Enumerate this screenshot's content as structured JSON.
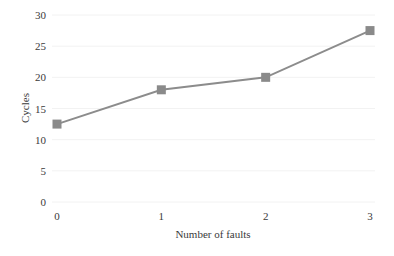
{
  "chart_data": {
    "type": "line",
    "title": "",
    "xlabel": "Number of faults",
    "ylabel": "Cycles",
    "categories": [
      "0",
      "1",
      "2",
      "3"
    ],
    "x": [
      0,
      1,
      2,
      3
    ],
    "series": [
      {
        "name": "Cycles",
        "values": [
          12.5,
          18,
          20,
          27.5
        ],
        "color": "#8c8c8c",
        "marker": "square",
        "marker_color": "#8a8a8a"
      }
    ],
    "ylim": [
      0,
      30
    ],
    "yticks": [
      0,
      5,
      10,
      15,
      20,
      25,
      30
    ],
    "xticks": [
      0,
      1,
      2,
      3
    ],
    "grid": true,
    "legend": null
  }
}
